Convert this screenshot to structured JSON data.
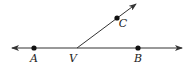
{
  "diagram": {
    "type": "geometry-angle",
    "colors": {
      "stroke": "#333333",
      "point": "#111111",
      "label": "#222222",
      "background": "#ffffff"
    },
    "line": {
      "x1": 12,
      "y1": 48,
      "x2": 182,
      "y2": 48,
      "arrows": "both"
    },
    "ray": {
      "x1": 77,
      "y1": 48,
      "x2": 136,
      "y2": 4,
      "arrow": "end"
    },
    "points": [
      {
        "name": "A",
        "x": 34,
        "y": 48,
        "label": "A",
        "lx": 34,
        "ly": 62,
        "dot": true
      },
      {
        "name": "V",
        "x": 77,
        "y": 48,
        "label": "V",
        "lx": 73,
        "ly": 62,
        "dot": false
      },
      {
        "name": "B",
        "x": 138,
        "y": 48,
        "label": "B",
        "lx": 138,
        "ly": 62,
        "dot": true
      },
      {
        "name": "C",
        "x": 117,
        "y": 18,
        "label": "C",
        "lx": 123,
        "ly": 27,
        "dot": true
      }
    ]
  }
}
